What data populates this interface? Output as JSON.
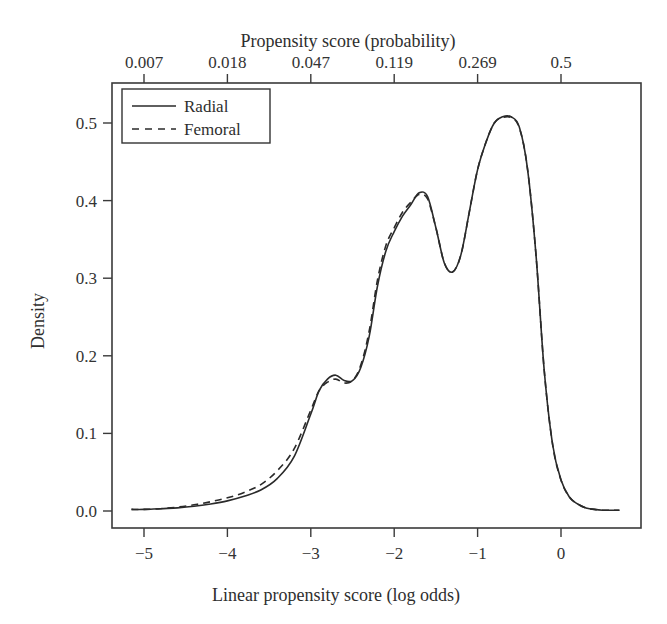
{
  "chart_data": {
    "type": "line",
    "title": "",
    "xlabel": "Linear propensity score (log odds)",
    "ylabel": "Density",
    "x2label": "Propensity score (probability)",
    "xlim": [
      -5.4,
      0.95
    ],
    "ylim": [
      -0.022,
      0.53
    ],
    "xticks": [
      -5,
      -4,
      -3,
      -2,
      -1,
      0
    ],
    "xtick_labels": [
      "−5",
      "−4",
      "−3",
      "−2",
      "−1",
      "0"
    ],
    "yticks": [
      0.0,
      0.1,
      0.2,
      0.3,
      0.4,
      0.5
    ],
    "ytick_labels": [
      "0.0",
      "0.1",
      "0.2",
      "0.3",
      "0.4",
      "0.5"
    ],
    "x2ticks": [
      -5,
      -4,
      -3,
      -2,
      -1,
      0
    ],
    "x2tick_labels": [
      "0.007",
      "0.018",
      "0.047",
      "0.119",
      "0.269",
      "0.5"
    ],
    "grid": false,
    "legend_position": "top-left",
    "series": [
      {
        "name": "Radial",
        "style": "solid",
        "x": [
          -5.15,
          -5.0,
          -4.8,
          -4.6,
          -4.4,
          -4.2,
          -4.0,
          -3.8,
          -3.6,
          -3.4,
          -3.2,
          -3.0,
          -2.9,
          -2.8,
          -2.7,
          -2.6,
          -2.5,
          -2.4,
          -2.3,
          -2.2,
          -2.1,
          -2.0,
          -1.9,
          -1.8,
          -1.7,
          -1.6,
          -1.5,
          -1.4,
          -1.3,
          -1.2,
          -1.1,
          -1.0,
          -0.9,
          -0.8,
          -0.7,
          -0.6,
          -0.5,
          -0.4,
          -0.3,
          -0.2,
          -0.1,
          0.0,
          0.1,
          0.2,
          0.3,
          0.4,
          0.5,
          0.6,
          0.7
        ],
        "y": [
          0.002,
          0.002,
          0.003,
          0.004,
          0.006,
          0.009,
          0.013,
          0.019,
          0.027,
          0.042,
          0.07,
          0.125,
          0.155,
          0.17,
          0.175,
          0.168,
          0.168,
          0.185,
          0.225,
          0.29,
          0.335,
          0.36,
          0.38,
          0.395,
          0.41,
          0.405,
          0.365,
          0.32,
          0.308,
          0.33,
          0.385,
          0.44,
          0.475,
          0.5,
          0.508,
          0.508,
          0.495,
          0.44,
          0.33,
          0.18,
          0.085,
          0.04,
          0.018,
          0.009,
          0.004,
          0.002,
          0.001,
          0.001,
          0.001
        ]
      },
      {
        "name": "Femoral",
        "style": "dashed",
        "x": [
          -5.15,
          -5.0,
          -4.8,
          -4.6,
          -4.4,
          -4.2,
          -4.0,
          -3.8,
          -3.6,
          -3.4,
          -3.2,
          -3.0,
          -2.9,
          -2.8,
          -2.7,
          -2.6,
          -2.5,
          -2.4,
          -2.3,
          -2.2,
          -2.1,
          -2.0,
          -1.9,
          -1.8,
          -1.7,
          -1.6,
          -1.5,
          -1.4,
          -1.3,
          -1.2,
          -1.1,
          -1.0,
          -0.9,
          -0.8,
          -0.7,
          -0.6,
          -0.5,
          -0.4,
          -0.3,
          -0.2,
          -0.1,
          0.0,
          0.1,
          0.2,
          0.3,
          0.4,
          0.5,
          0.6,
          0.7
        ],
        "y": [
          0.002,
          0.002,
          0.003,
          0.005,
          0.008,
          0.012,
          0.017,
          0.024,
          0.034,
          0.052,
          0.08,
          0.13,
          0.155,
          0.166,
          0.17,
          0.165,
          0.168,
          0.188,
          0.232,
          0.298,
          0.342,
          0.365,
          0.385,
          0.398,
          0.408,
          0.402,
          0.365,
          0.32,
          0.308,
          0.33,
          0.385,
          0.44,
          0.475,
          0.5,
          0.507,
          0.507,
          0.494,
          0.44,
          0.33,
          0.18,
          0.085,
          0.04,
          0.018,
          0.009,
          0.004,
          0.002,
          0.001,
          0.001,
          0.001
        ]
      }
    ],
    "legend": [
      {
        "label": "Radial",
        "style": "solid"
      },
      {
        "label": "Femoral",
        "style": "dashed"
      }
    ]
  },
  "colors": {
    "line": "#2a2a2a",
    "frame": "#3a3a3a",
    "background": "#ffffff"
  }
}
